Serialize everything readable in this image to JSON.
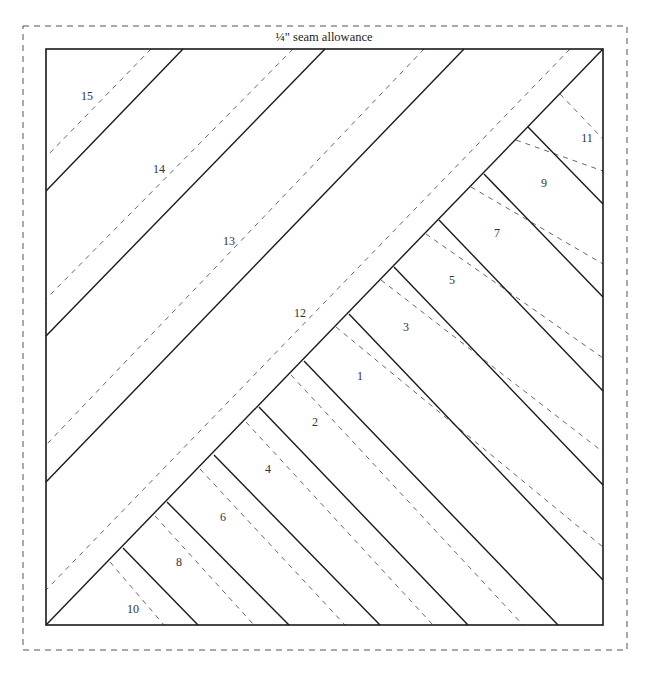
{
  "title": "¼\" seam allowance",
  "colors": {
    "background": "#ffffff",
    "outline": "#1a1a1a",
    "seam_line": "#1a1a1a",
    "cut_line": "#555555",
    "allowance_border": "#555555",
    "label": "#333333"
  },
  "geometry": {
    "allowance_rect": {
      "x1": 23,
      "y1": 26,
      "x2": 627,
      "y2": 650
    },
    "block_rect": {
      "x1": 46,
      "y1": 49,
      "x2": 603,
      "y2": 625
    },
    "main_diagonal": {
      "x1": 46,
      "y1": 625,
      "x2": 603,
      "y2": 49
    }
  },
  "lines": {
    "upper_solid": [
      {
        "x1": 183,
        "y1": 49,
        "x2": 46,
        "y2": 191
      },
      {
        "x1": 325,
        "y1": 49,
        "x2": 46,
        "y2": 336
      },
      {
        "x1": 464,
        "y1": 49,
        "x2": 46,
        "y2": 482
      }
    ],
    "upper_dashed": [
      {
        "x1": 151,
        "y1": 49,
        "x2": 46,
        "y2": 157
      },
      {
        "x1": 293,
        "y1": 49,
        "x2": 46,
        "y2": 299
      },
      {
        "x1": 424,
        "y1": 49,
        "x2": 46,
        "y2": 445
      },
      {
        "x1": 570,
        "y1": 49,
        "x2": 46,
        "y2": 590
      }
    ],
    "right_solid": [
      {
        "x1": 528,
        "y1": 127,
        "x2": 603,
        "y2": 204
      },
      {
        "x1": 484,
        "y1": 174,
        "x2": 603,
        "y2": 297
      },
      {
        "x1": 439,
        "y1": 220,
        "x2": 603,
        "y2": 391
      },
      {
        "x1": 394,
        "y1": 267,
        "x2": 603,
        "y2": 485
      },
      {
        "x1": 349,
        "y1": 314,
        "x2": 603,
        "y2": 580
      }
    ],
    "right_dashed": [
      {
        "x1": 560,
        "y1": 94,
        "x2": 603,
        "y2": 139
      },
      {
        "x1": 516,
        "y1": 140,
        "x2": 603,
        "y2": 171
      },
      {
        "x1": 471,
        "y1": 187,
        "x2": 603,
        "y2": 264
      },
      {
        "x1": 426,
        "y1": 234,
        "x2": 603,
        "y2": 358
      },
      {
        "x1": 381,
        "y1": 280,
        "x2": 603,
        "y2": 452
      },
      {
        "x1": 336,
        "y1": 327,
        "x2": 603,
        "y2": 547
      }
    ],
    "bottom_solid": [
      {
        "x1": 304,
        "y1": 361,
        "x2": 558,
        "y2": 625
      },
      {
        "x1": 259,
        "y1": 407,
        "x2": 468,
        "y2": 625
      },
      {
        "x1": 214,
        "y1": 455,
        "x2": 380,
        "y2": 625
      },
      {
        "x1": 167,
        "y1": 502,
        "x2": 289,
        "y2": 625
      },
      {
        "x1": 123,
        "y1": 548,
        "x2": 198,
        "y2": 625
      }
    ],
    "bottom_dashed": [
      {
        "x1": 291,
        "y1": 375,
        "x2": 523,
        "y2": 625
      },
      {
        "x1": 246,
        "y1": 422,
        "x2": 433,
        "y2": 625
      },
      {
        "x1": 200,
        "y1": 469,
        "x2": 345,
        "y2": 625
      },
      {
        "x1": 155,
        "y1": 516,
        "x2": 254,
        "y2": 625
      },
      {
        "x1": 110,
        "y1": 562,
        "x2": 164,
        "y2": 625
      }
    ]
  },
  "labels": [
    {
      "text": "15",
      "x": 87,
      "y": 96
    },
    {
      "text": "14",
      "x": 159,
      "y": 169
    },
    {
      "text": "13",
      "x": 229,
      "y": 241
    },
    {
      "text": "12",
      "x": 300,
      "y": 313
    },
    {
      "text": "11",
      "x": 587,
      "y": 138
    },
    {
      "text": "9",
      "x": 544,
      "y": 183
    },
    {
      "text": "7",
      "x": 497,
      "y": 233
    },
    {
      "text": "5",
      "x": 452,
      "y": 280
    },
    {
      "text": "3",
      "x": 406,
      "y": 327
    },
    {
      "text": "1",
      "x": 360,
      "y": 376
    },
    {
      "text": "2",
      "x": 315,
      "y": 422
    },
    {
      "text": "4",
      "x": 268,
      "y": 469
    },
    {
      "text": "6",
      "x": 223,
      "y": 517
    },
    {
      "text": "8",
      "x": 179,
      "y": 562
    },
    {
      "text": "10",
      "x": 133,
      "y": 609
    }
  ]
}
